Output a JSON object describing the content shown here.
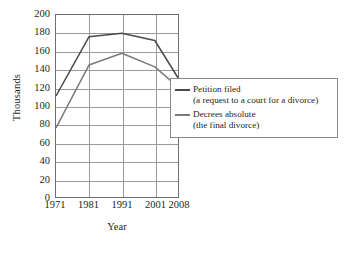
{
  "chart_data": {
    "type": "line",
    "title": "",
    "xlabel": "Year",
    "ylabel": "Thousands",
    "categories": [
      "1971",
      "1981",
      "1991",
      "2001",
      "2008"
    ],
    "category_positions": [
      0,
      27,
      54,
      81,
      100
    ],
    "ylim": [
      0,
      200
    ],
    "ytick_values": [
      0,
      20,
      40,
      60,
      80,
      100,
      120,
      140,
      160,
      180,
      200
    ],
    "ytick_labels": [
      "0",
      "20",
      "40",
      "60",
      "80",
      "100",
      "120",
      "140",
      "160",
      "180",
      "200"
    ],
    "grid": "both",
    "legend_position": "right",
    "series": [
      {
        "name": "Petition filed",
        "sublabel": "(a request to a court for a divorce)",
        "color": "#4a4a4a",
        "values": [
          111,
          176,
          180,
          172,
          131
        ]
      },
      {
        "name": "Decrees absolute",
        "sublabel": "(the final divorce)",
        "color": "#7a7a7a",
        "values": [
          76,
          145,
          158,
          143,
          121
        ]
      }
    ]
  },
  "axes": {
    "y_title": "Thousands",
    "x_title": "Year"
  },
  "colors": {
    "frame": "#6f6f6f",
    "grid": "#9a9a9a",
    "text": "#231f20",
    "background": "#ffffff"
  }
}
